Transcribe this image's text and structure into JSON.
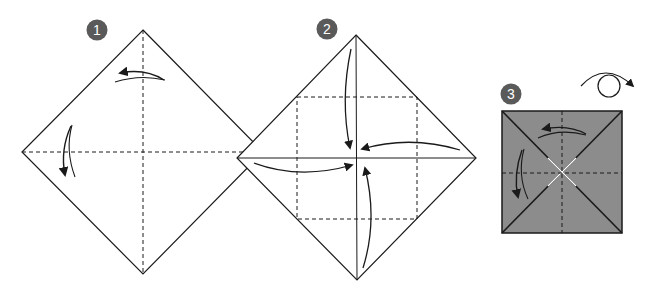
{
  "colors": {
    "line": "#1a1a1a",
    "badge": "#5a5a5a",
    "paper_color_side": "#8c8c8c",
    "paper_white_side": "#ffffff"
  },
  "steps": [
    {
      "number": "1",
      "description": "Fold in half both ways to make diagonal creases and unfold",
      "shape": "diamond",
      "creases": [
        "vertical-valley",
        "horizontal-valley"
      ],
      "arrows": [
        "fold-left-arrow",
        "fold-down-arrow"
      ]
    },
    {
      "number": "2",
      "description": "Fold all four corners to the center",
      "shape": "diamond",
      "creases": [
        "center-square-valley"
      ],
      "arrows": [
        "top-corner-to-center",
        "right-corner-to-center",
        "bottom-corner-to-center",
        "left-corner-to-center"
      ]
    },
    {
      "number": "3",
      "description": "Fold and unfold in half both ways, then turn over",
      "shape": "square",
      "creases": [
        "vertical-valley",
        "horizontal-valley"
      ],
      "arrows": [
        "fold-left-arrow",
        "fold-down-arrow"
      ],
      "symbol": "turn-over-icon"
    }
  ]
}
